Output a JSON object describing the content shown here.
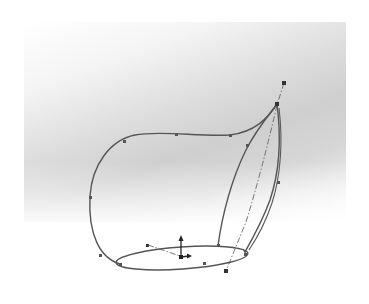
{
  "figure": {
    "type": "3D CAD wireframe sketch",
    "colors": {
      "background": "#ffffff",
      "viewport_gradient_dark": "#cfcfcf",
      "curve_stroke": "#555555",
      "centerline_stroke": "#666666"
    },
    "elements": {
      "base_profile": "ellipse",
      "guide_curves": [
        "outer-left-guide",
        "inner-guide",
        "right-guide"
      ],
      "path": "dash-dot centerline",
      "triad": "origin coordinate triad (up arrow, right arrow)"
    }
  }
}
